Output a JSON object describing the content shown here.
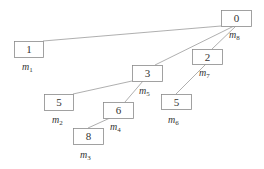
{
  "diagram": {
    "type": "tree",
    "nodes": [
      {
        "id": "n0",
        "value": "0",
        "label": "m",
        "sub": "8",
        "x": 221,
        "y": 10,
        "w": 30,
        "h": 16,
        "lx": 229,
        "ly": 38
      },
      {
        "id": "n1",
        "value": "1",
        "label": "m",
        "sub": "1",
        "x": 14,
        "y": 41,
        "w": 29,
        "h": 16,
        "lx": 22,
        "ly": 70
      },
      {
        "id": "n2",
        "value": "2",
        "label": "m",
        "sub": "7",
        "x": 192,
        "y": 49,
        "w": 30,
        "h": 15,
        "lx": 199,
        "ly": 76
      },
      {
        "id": "n3",
        "value": "3",
        "label": "m",
        "sub": "5",
        "x": 132,
        "y": 65,
        "w": 30,
        "h": 16,
        "lx": 139,
        "ly": 94
      },
      {
        "id": "n5a",
        "value": "5",
        "label": "m",
        "sub": "2",
        "x": 44,
        "y": 94,
        "w": 29,
        "h": 16,
        "lx": 52,
        "ly": 123
      },
      {
        "id": "n5b",
        "value": "5",
        "label": "m",
        "sub": "6",
        "x": 161,
        "y": 94,
        "w": 30,
        "h": 15,
        "lx": 168,
        "ly": 123
      },
      {
        "id": "n6",
        "value": "6",
        "label": "m",
        "sub": "4",
        "x": 103,
        "y": 102,
        "w": 30,
        "h": 16,
        "lx": 110,
        "ly": 130
      },
      {
        "id": "n8",
        "value": "8",
        "label": "m",
        "sub": "3",
        "x": 73,
        "y": 128,
        "w": 30,
        "h": 16,
        "lx": 80,
        "ly": 158
      }
    ],
    "edges": [
      {
        "from": "n0",
        "to": "n1",
        "x1": 221,
        "y1": 26,
        "x2": 43,
        "y2": 41
      },
      {
        "from": "n0",
        "to": "n3",
        "x1": 234,
        "y1": 26,
        "x2": 155,
        "y2": 65
      },
      {
        "from": "n0",
        "to": "n2",
        "x1": 236,
        "y1": 26,
        "x2": 212,
        "y2": 49
      },
      {
        "from": "n3",
        "to": "n5a",
        "x1": 132,
        "y1": 81,
        "x2": 73,
        "y2": 94
      },
      {
        "from": "n3",
        "to": "n6",
        "x1": 143,
        "y1": 81,
        "x2": 125,
        "y2": 102
      },
      {
        "from": "n2",
        "to": "n5b",
        "x1": 206,
        "y1": 64,
        "x2": 176,
        "y2": 94
      },
      {
        "from": "n6",
        "to": "n8",
        "x1": 110,
        "y1": 118,
        "x2": 88,
        "y2": 128
      }
    ]
  }
}
